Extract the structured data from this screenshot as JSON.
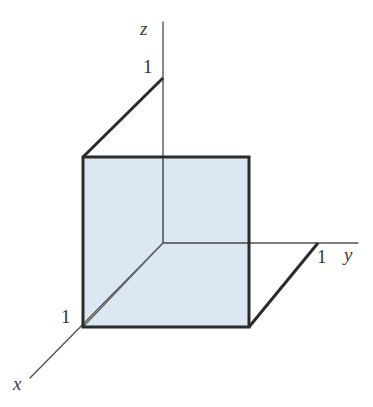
{
  "figure": {
    "kind": "3d-coordinate-axes-with-unit-square",
    "title": "",
    "background_color": "#ffffff"
  },
  "axes": [
    {
      "id": "z",
      "label": "z",
      "label_x": 140,
      "label_y": 35,
      "line": {
        "x1": 163,
        "y1": 22,
        "x2": 163,
        "y2": 243
      },
      "color": "#555555",
      "width": 1.4
    },
    {
      "id": "y",
      "label": "y",
      "label_x": 344,
      "label_y": 261,
      "line": {
        "x1": 163,
        "y1": 243,
        "x2": 358,
        "y2": 243
      },
      "color": "#555555",
      "width": 1.4
    },
    {
      "id": "x",
      "label": "x",
      "label_x": 13,
      "label_y": 390,
      "line": {
        "x1": 163,
        "y1": 243,
        "x2": 30,
        "y2": 378
      },
      "color": "#555555",
      "width": 1.4
    }
  ],
  "ticks": [
    {
      "id": "z-unit",
      "label": "1",
      "label_x": 143,
      "label_y": 73,
      "point_x": 163,
      "point_y": 78
    },
    {
      "id": "x-unit",
      "label": "1",
      "label_x": 61,
      "label_y": 323,
      "point_x": 83,
      "point_y": 327
    },
    {
      "id": "y-unit",
      "label": "1",
      "label_x": 317,
      "label_y": 263,
      "point_x": 318,
      "point_y": 243
    }
  ],
  "square": {
    "name": "unit-square-face",
    "fill_color": "#dbe8f4",
    "stroke_color": "#2b2b2b",
    "stroke_width": 3,
    "points": "83,157 249,157 249,327 83,327",
    "corners": {
      "top_left": {
        "x": 83,
        "y": 157
      },
      "top_right": {
        "x": 249,
        "y": 157
      },
      "bottom_right": {
        "x": 249,
        "y": 327
      },
      "bottom_left": {
        "x": 83,
        "y": 327
      }
    }
  },
  "connectors": [
    {
      "id": "z-unit-to-square-top-left",
      "x1": 163,
      "y1": 78,
      "x2": 83,
      "y2": 157,
      "color": "#2b2b2b",
      "width": 3
    },
    {
      "id": "y-unit-to-square-bottom-right",
      "x1": 318,
      "y1": 243,
      "x2": 249,
      "y2": 327,
      "color": "#2b2b2b",
      "width": 3
    }
  ],
  "interior_lines": [
    {
      "id": "z-axis-through-square",
      "x1": 163,
      "y1": 157,
      "x2": 163,
      "y2": 243,
      "color": "#6a6a6a",
      "width": 1.4
    },
    {
      "id": "y-axis-through-square",
      "x1": 163,
      "y1": 243,
      "x2": 249,
      "y2": 243,
      "color": "#6a6a6a",
      "width": 1.4
    },
    {
      "id": "x-axis-through-square",
      "x1": 163,
      "y1": 243,
      "x2": 83,
      "y2": 327,
      "color": "#6a6a6a",
      "width": 1.4
    }
  ]
}
